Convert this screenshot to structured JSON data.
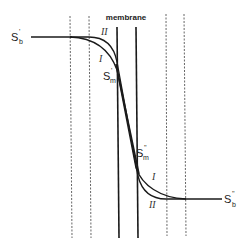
{
  "diagram": {
    "title_label": "membrane",
    "labels": {
      "left_bath": {
        "symbol": "S",
        "superscript": "'",
        "subscript": "b"
      },
      "right_bath": {
        "symbol": "S",
        "superscript": "''",
        "subscript": "b"
      },
      "left_membrane": {
        "symbol": "S",
        "superscript": "'",
        "subscript": "m"
      },
      "right_membrane": {
        "symbol": "S",
        "superscript": "''",
        "subscript": "m"
      }
    },
    "curve_labels": {
      "upper_left_curve_II": "II",
      "upper_left_curve_I": "I",
      "lower_right_curve_I": "I",
      "lower_right_curve_II": "II"
    },
    "elements": {
      "dashed_boundaries": 4,
      "membrane_walls": 2,
      "curves": [
        "I",
        "II"
      ]
    },
    "colors": {
      "line": "#1a1a1a",
      "dashed": "#555555",
      "background": "#ffffff"
    }
  }
}
